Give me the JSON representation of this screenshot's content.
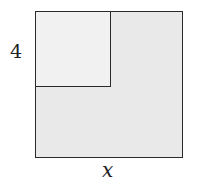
{
  "diagram": {
    "labels": {
      "inner_side": "4",
      "outer_side": "x"
    },
    "colors": {
      "outer_fill": "#e9e9e9",
      "inner_fill": "#f1f1f1",
      "stroke": "#2a2a2a"
    }
  }
}
